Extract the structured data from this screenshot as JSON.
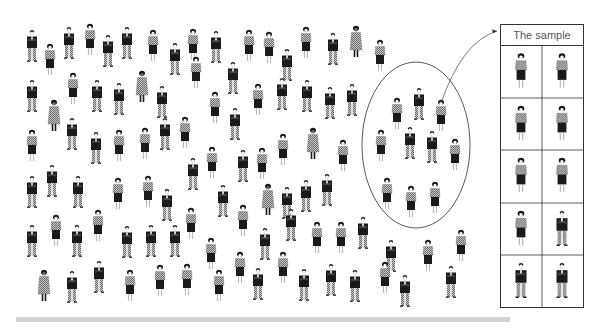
{
  "diagram": {
    "type": "population-sampling-illustration",
    "sample_box": {
      "title": "The sample",
      "rows": 5,
      "cols": 2,
      "cells": [
        "woman",
        "woman",
        "woman",
        "woman",
        "woman",
        "woman",
        "woman",
        "man",
        "man",
        "man"
      ]
    },
    "selection_ellipse": {
      "cx": 416,
      "cy": 145,
      "rx": 54,
      "ry": 83,
      "figures": [
        {
          "x": 397,
          "y": 98,
          "t": "woman"
        },
        {
          "x": 419,
          "y": 88,
          "t": "man"
        },
        {
          "x": 441,
          "y": 100,
          "t": "woman"
        },
        {
          "x": 381,
          "y": 130,
          "t": "woman"
        },
        {
          "x": 410,
          "y": 127,
          "t": "man"
        },
        {
          "x": 432,
          "y": 131,
          "t": "man"
        },
        {
          "x": 455,
          "y": 139,
          "t": "woman"
        },
        {
          "x": 387,
          "y": 178,
          "t": "woman"
        },
        {
          "x": 411,
          "y": 186,
          "t": "woman"
        },
        {
          "x": 435,
          "y": 182,
          "t": "woman"
        }
      ]
    },
    "arrow": {
      "from": "ellipse",
      "to": "sample_box"
    },
    "colors": {
      "ink": "#1a1a1a",
      "pattern": "#8a8a8a",
      "line": "#444444",
      "bar": "#d4d4d4"
    },
    "population": [
      {
        "x": 32,
        "y": 30,
        "t": "man"
      },
      {
        "x": 50,
        "y": 44,
        "t": "woman"
      },
      {
        "x": 69,
        "y": 27,
        "t": "man"
      },
      {
        "x": 90,
        "y": 24,
        "t": "woman"
      },
      {
        "x": 108,
        "y": 35,
        "t": "man"
      },
      {
        "x": 127,
        "y": 27,
        "t": "man"
      },
      {
        "x": 153,
        "y": 30,
        "t": "woman"
      },
      {
        "x": 175,
        "y": 43,
        "t": "man"
      },
      {
        "x": 193,
        "y": 29,
        "t": "woman"
      },
      {
        "x": 216,
        "y": 31,
        "t": "man"
      },
      {
        "x": 249,
        "y": 30,
        "t": "woman"
      },
      {
        "x": 269,
        "y": 32,
        "t": "woman"
      },
      {
        "x": 287,
        "y": 49,
        "t": "man"
      },
      {
        "x": 306,
        "y": 27,
        "t": "woman"
      },
      {
        "x": 333,
        "y": 33,
        "t": "man"
      },
      {
        "x": 356,
        "y": 26,
        "t": "coat"
      },
      {
        "x": 380,
        "y": 40,
        "t": "woman"
      },
      {
        "x": 32,
        "y": 80,
        "t": "man"
      },
      {
        "x": 54,
        "y": 100,
        "t": "coat"
      },
      {
        "x": 73,
        "y": 73,
        "t": "woman"
      },
      {
        "x": 97,
        "y": 80,
        "t": "man"
      },
      {
        "x": 119,
        "y": 83,
        "t": "man"
      },
      {
        "x": 142,
        "y": 71,
        "t": "coat"
      },
      {
        "x": 162,
        "y": 86,
        "t": "man"
      },
      {
        "x": 196,
        "y": 57,
        "t": "woman"
      },
      {
        "x": 215,
        "y": 92,
        "t": "woman"
      },
      {
        "x": 233,
        "y": 62,
        "t": "man"
      },
      {
        "x": 258,
        "y": 84,
        "t": "woman"
      },
      {
        "x": 282,
        "y": 78,
        "t": "man"
      },
      {
        "x": 307,
        "y": 80,
        "t": "man"
      },
      {
        "x": 330,
        "y": 87,
        "t": "man"
      },
      {
        "x": 352,
        "y": 84,
        "t": "man"
      },
      {
        "x": 32,
        "y": 130,
        "t": "woman"
      },
      {
        "x": 72,
        "y": 118,
        "t": "man"
      },
      {
        "x": 96,
        "y": 132,
        "t": "man"
      },
      {
        "x": 119,
        "y": 130,
        "t": "woman"
      },
      {
        "x": 145,
        "y": 128,
        "t": "woman"
      },
      {
        "x": 165,
        "y": 118,
        "t": "man"
      },
      {
        "x": 185,
        "y": 117,
        "t": "woman"
      },
      {
        "x": 212,
        "y": 147,
        "t": "woman"
      },
      {
        "x": 235,
        "y": 108,
        "t": "man"
      },
      {
        "x": 262,
        "y": 148,
        "t": "woman"
      },
      {
        "x": 283,
        "y": 134,
        "t": "woman"
      },
      {
        "x": 313,
        "y": 128,
        "t": "coat"
      },
      {
        "x": 343,
        "y": 140,
        "t": "woman"
      },
      {
        "x": 32,
        "y": 176,
        "t": "man"
      },
      {
        "x": 52,
        "y": 165,
        "t": "man"
      },
      {
        "x": 78,
        "y": 176,
        "t": "man"
      },
      {
        "x": 118,
        "y": 178,
        "t": "woman"
      },
      {
        "x": 148,
        "y": 176,
        "t": "woman"
      },
      {
        "x": 167,
        "y": 189,
        "t": "man"
      },
      {
        "x": 193,
        "y": 158,
        "t": "man"
      },
      {
        "x": 223,
        "y": 185,
        "t": "man"
      },
      {
        "x": 243,
        "y": 150,
        "t": "man"
      },
      {
        "x": 268,
        "y": 184,
        "t": "coat"
      },
      {
        "x": 287,
        "y": 187,
        "t": "man"
      },
      {
        "x": 306,
        "y": 180,
        "t": "man"
      },
      {
        "x": 327,
        "y": 174,
        "t": "man"
      },
      {
        "x": 32,
        "y": 225,
        "t": "man"
      },
      {
        "x": 56,
        "y": 215,
        "t": "woman"
      },
      {
        "x": 77,
        "y": 225,
        "t": "man"
      },
      {
        "x": 98,
        "y": 210,
        "t": "woman"
      },
      {
        "x": 127,
        "y": 226,
        "t": "man"
      },
      {
        "x": 151,
        "y": 225,
        "t": "man"
      },
      {
        "x": 175,
        "y": 225,
        "t": "man"
      },
      {
        "x": 191,
        "y": 208,
        "t": "woman"
      },
      {
        "x": 211,
        "y": 238,
        "t": "woman"
      },
      {
        "x": 243,
        "y": 205,
        "t": "woman"
      },
      {
        "x": 265,
        "y": 228,
        "t": "man"
      },
      {
        "x": 291,
        "y": 209,
        "t": "man"
      },
      {
        "x": 317,
        "y": 222,
        "t": "woman"
      },
      {
        "x": 341,
        "y": 222,
        "t": "woman"
      },
      {
        "x": 363,
        "y": 217,
        "t": "man"
      },
      {
        "x": 391,
        "y": 240,
        "t": "man"
      },
      {
        "x": 428,
        "y": 240,
        "t": "woman"
      },
      {
        "x": 461,
        "y": 230,
        "t": "woman"
      },
      {
        "x": 44,
        "y": 270,
        "t": "coat"
      },
      {
        "x": 72,
        "y": 271,
        "t": "man"
      },
      {
        "x": 99,
        "y": 261,
        "t": "man"
      },
      {
        "x": 130,
        "y": 270,
        "t": "woman"
      },
      {
        "x": 160,
        "y": 265,
        "t": "woman"
      },
      {
        "x": 187,
        "y": 264,
        "t": "woman"
      },
      {
        "x": 219,
        "y": 270,
        "t": "woman"
      },
      {
        "x": 240,
        "y": 252,
        "t": "woman"
      },
      {
        "x": 258,
        "y": 268,
        "t": "man"
      },
      {
        "x": 283,
        "y": 252,
        "t": "woman"
      },
      {
        "x": 304,
        "y": 269,
        "t": "man"
      },
      {
        "x": 331,
        "y": 264,
        "t": "man"
      },
      {
        "x": 355,
        "y": 270,
        "t": "man"
      },
      {
        "x": 385,
        "y": 262,
        "t": "woman"
      },
      {
        "x": 405,
        "y": 275,
        "t": "man"
      },
      {
        "x": 451,
        "y": 266,
        "t": "man"
      }
    ]
  }
}
